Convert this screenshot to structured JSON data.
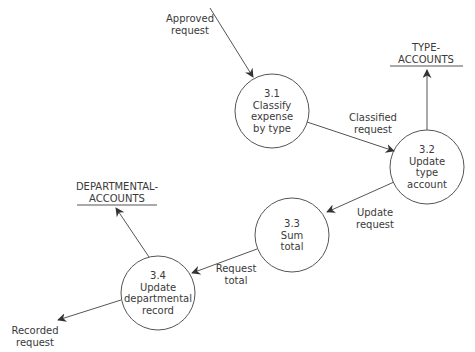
{
  "diagram": {
    "type": "data-flow-diagram",
    "processes": [
      {
        "id": "3.1",
        "name": "Classify\nexpense\nby type",
        "cx": 272,
        "cy": 111,
        "r": 37
      },
      {
        "id": "3.2",
        "name": "Update\ntype\naccount",
        "cx": 427,
        "cy": 167,
        "r": 37
      },
      {
        "id": "3.3",
        "name": "Sum\ntotal",
        "cx": 292,
        "cy": 235,
        "r": 37
      },
      {
        "id": "3.4",
        "name": "Update\ndepartmental\nrecord",
        "cx": 158,
        "cy": 293,
        "r": 37
      }
    ],
    "data_stores": [
      {
        "name": "TYPE-\nACCOUNTS",
        "x1": 390,
        "x2": 463,
        "y": 66,
        "label_x": 426,
        "label_y": 42
      },
      {
        "name": "DEPARTMENTAL-\nACCOUNTS",
        "x1": 77,
        "x2": 157,
        "y": 205,
        "label_x": 117,
        "label_y": 181
      }
    ],
    "flows": [
      {
        "label": "Approved\nrequest",
        "from": [
          210,
          8
        ],
        "to": [
          253,
          77
        ],
        "label_x": 190,
        "label_y": 13
      },
      {
        "label": "Classified\nrequest",
        "from": [
          307,
          122
        ],
        "to": [
          394,
          151
        ],
        "label_x": 373,
        "label_y": 112
      },
      {
        "label": "",
        "from": [
          427,
          130
        ],
        "to": [
          427,
          70
        ],
        "label_x": 0,
        "label_y": 0
      },
      {
        "label": "Update\nrequest",
        "from": [
          394,
          182
        ],
        "to": [
          327,
          212
        ],
        "label_x": 375,
        "label_y": 207
      },
      {
        "label": "Request\ntotal",
        "from": [
          257,
          249
        ],
        "to": [
          192,
          273
        ],
        "label_x": 236,
        "label_y": 263
      },
      {
        "label": "",
        "from": [
          149,
          257
        ],
        "to": [
          116,
          208
        ],
        "label_x": 0,
        "label_y": 0
      },
      {
        "label": "Recorded\nrequest",
        "from": [
          121,
          300
        ],
        "to": [
          58,
          320
        ],
        "label_x": 35,
        "label_y": 325
      }
    ]
  }
}
